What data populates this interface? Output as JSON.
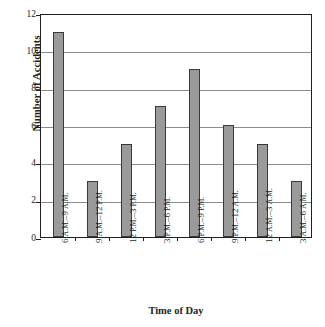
{
  "chart_data": {
    "type": "bar",
    "title": "",
    "xlabel": "Time of Day",
    "ylabel": "Number of Accidents",
    "categories": [
      "6 A.M.–9 A.M.",
      "9 A.M.–12 P.M.",
      "12 P.M.–3 P.M.",
      "3 P.M.–6 P.M.",
      "6 P.M.–9 P.M.",
      "9 P.M.–12 A.M.",
      "12 A.M.–3 A.M.",
      "3 A.M.–6 A.M."
    ],
    "values": [
      11,
      3,
      5,
      7,
      9,
      6,
      5,
      3
    ],
    "ylim": [
      0,
      12
    ],
    "yticks": [
      0,
      2,
      4,
      6,
      8,
      10,
      12
    ],
    "ytick_labels": [
      "0",
      "2",
      "4",
      "6",
      "8",
      "10",
      "12"
    ],
    "grid": true,
    "grid_axis": "y",
    "legend": false,
    "bar_color": "#9a9a9a",
    "bar_edge_color": "#3a3a3a",
    "grid_color": "#8c8c8c",
    "axis_color": "#231f20",
    "background_color": "#ffffff",
    "xtick_label_rotation": 90,
    "category_parts": [
      {
        "a": "6 ",
        "b": "A.M.",
        "c": "–9 ",
        "d": "A.M."
      },
      {
        "a": "9 ",
        "b": "A.M.",
        "c": "–12 ",
        "d": "P.M."
      },
      {
        "a": "12 ",
        "b": "P.M.",
        "c": "–3 ",
        "d": "P.M."
      },
      {
        "a": "3 ",
        "b": "P.M.",
        "c": "–6 ",
        "d": "P.M."
      },
      {
        "a": "6 ",
        "b": "P.M.",
        "c": "–9 ",
        "d": "P.M."
      },
      {
        "a": "9 ",
        "b": "P.M.",
        "c": "–12 ",
        "d": "A.M."
      },
      {
        "a": "12 ",
        "b": "A.M.",
        "c": "–3 ",
        "d": "A.M."
      },
      {
        "a": "3 ",
        "b": "A.M.",
        "c": "–6 ",
        "d": "A.M."
      }
    ]
  }
}
